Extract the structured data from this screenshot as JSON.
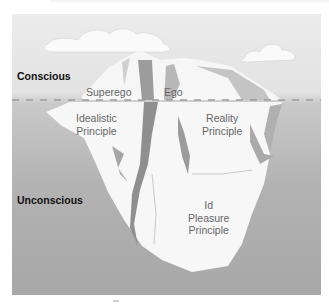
{
  "diagram": {
    "type": "iceberg model of the mind",
    "zones": [
      {
        "id": "conscious",
        "label": "Conscious"
      },
      {
        "id": "unconscious",
        "label": "Unconscious"
      }
    ],
    "parts": [
      {
        "id": "superego",
        "label": "Superego",
        "principle_line1": "Idealistic",
        "principle_line2": "Principle"
      },
      {
        "id": "ego",
        "label": "Ego",
        "principle_line1": "Reality",
        "principle_line2": "Principle"
      },
      {
        "id": "id",
        "label": "Id",
        "principle_line1": "Pleasure",
        "principle_line2": "Principle"
      }
    ],
    "waterline": "dashed",
    "colors": {
      "sky": "#ececec",
      "water_top": "#c9c9c9",
      "water_bottom": "#a7a7a7",
      "ice": "#f8f8f8",
      "ice_shadow": "#9a9a9a",
      "zone_label": "#111111",
      "part_label": "#666666"
    }
  }
}
